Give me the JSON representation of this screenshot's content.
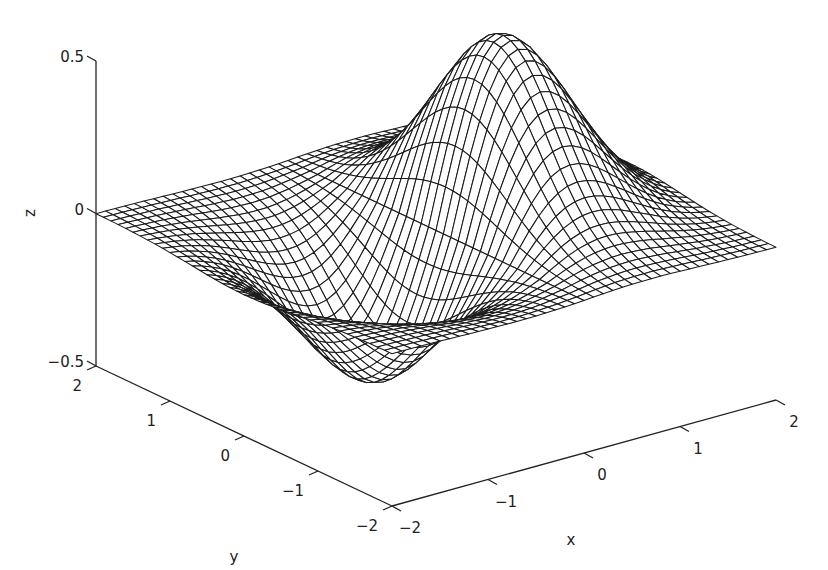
{
  "chart_data": {
    "type": "surface",
    "subtype": "3d-mesh",
    "title": "",
    "function": "z = x * exp(-x^2 - y^2)",
    "xlabel": "x",
    "ylabel": "y",
    "zlabel": "z",
    "xlim": [
      -2,
      2
    ],
    "ylim": [
      -2,
      2
    ],
    "zlim": [
      -0.5,
      0.5
    ],
    "x_ticks": [
      -2,
      -1,
      0,
      1,
      2
    ],
    "y_ticks": [
      -2,
      -1,
      0,
      1,
      2
    ],
    "z_ticks": [
      -0.5,
      0,
      0.5
    ],
    "x_tick_labels": [
      "−2",
      "−1",
      "0",
      "1",
      "2"
    ],
    "y_tick_labels": [
      "−2",
      "−1",
      "0",
      "1",
      "2"
    ],
    "z_tick_labels": [
      "−0.5",
      "0",
      "0.5"
    ],
    "grid_resolution": 40,
    "z_max": 0.43,
    "z_min": -0.43,
    "z_max_location": {
      "x": 0.71,
      "y": 0
    },
    "z_min_location": {
      "x": -0.71,
      "y": 0
    },
    "grid": false,
    "legend": null,
    "mesh_color": "#1a1a1a",
    "face_color": "#ffffff"
  }
}
